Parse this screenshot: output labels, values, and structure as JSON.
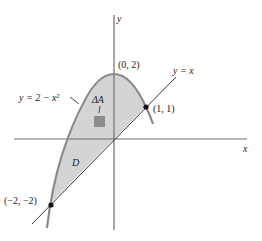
{
  "figure": {
    "type": "region-between-curves",
    "curve_label": "y = 2 − x²",
    "line_label": "y = x",
    "region_label": "D",
    "area_element_label": "ΔA",
    "x_axis_label": "x",
    "y_axis_label": "y",
    "points": [
      {
        "label": "(0, 2)",
        "x": 0,
        "y": 2,
        "marked": false
      },
      {
        "label": "(1, 1)",
        "x": 1,
        "y": 1,
        "marked": true
      },
      {
        "label": "(−2, −2)",
        "x": -2,
        "y": -2,
        "marked": true
      }
    ],
    "colors": {
      "region_fill": "#d4d4d4",
      "curve": "#8a8a8a",
      "axes": "#6e6e6e",
      "line": "#333333",
      "area_element": "#8c8c8c",
      "point": "#111111"
    }
  }
}
